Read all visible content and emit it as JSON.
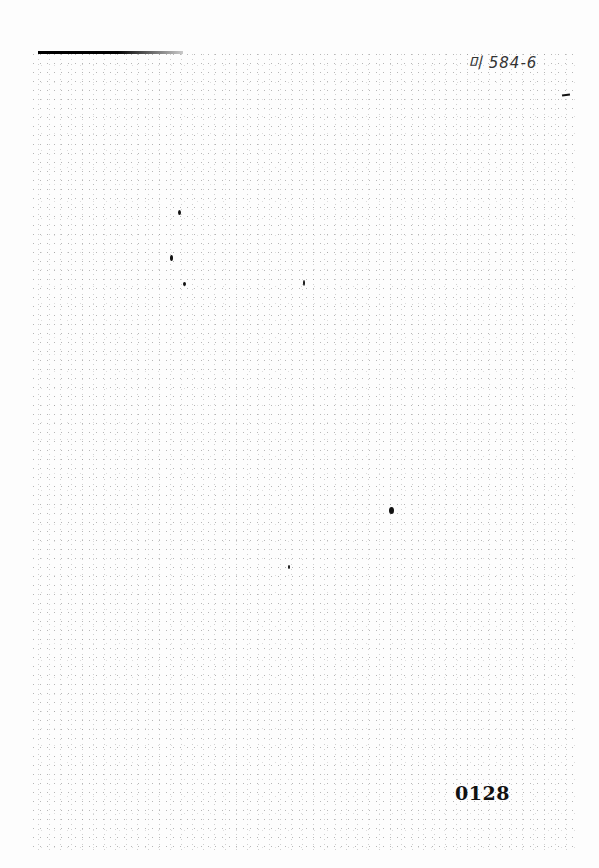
{
  "document": {
    "type": "scanned-page",
    "header": {
      "handwritten_label": "미 584-6"
    },
    "footer": {
      "page_number": "0128"
    },
    "body_text": ""
  },
  "colors": {
    "background": "#ffffff",
    "ink": "#111111"
  }
}
